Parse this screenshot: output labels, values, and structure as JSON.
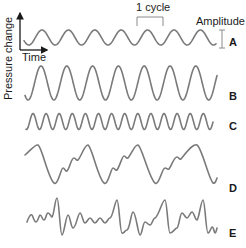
{
  "figure": {
    "axes": {
      "y_label": "Pressure change",
      "x_label": "Time"
    },
    "annotations": {
      "cycle_label": "1 cycle",
      "amplitude_label": "Amplitude"
    },
    "colors": {
      "wave": "#7a7a7a",
      "axis": "#1a1a1a",
      "text": "#1a1a1a"
    },
    "waves": [
      {
        "label": "A",
        "description": "pure tone, moderate amplitude, ~7 cycles"
      },
      {
        "label": "B",
        "description": "pure tone, larger amplitude, same frequency as A"
      },
      {
        "label": "C",
        "description": "pure tone, higher frequency, ~14 cycles"
      },
      {
        "label": "D",
        "description": "complex periodic wave, 4 repeating cycles"
      },
      {
        "label": "E",
        "description": "complex aperiodic/noisy wave"
      }
    ]
  }
}
